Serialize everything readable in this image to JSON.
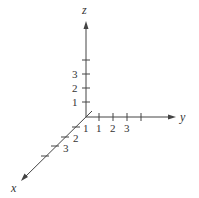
{
  "diagram": {
    "axes": {
      "x": {
        "label": "x",
        "ticks": [
          "1",
          "2",
          "3"
        ]
      },
      "y": {
        "label": "y",
        "ticks": [
          "1",
          "2",
          "3"
        ]
      },
      "z": {
        "label": "z",
        "ticks": [
          "1",
          "2",
          "3"
        ]
      }
    },
    "colors": {
      "stroke": "#444444",
      "text": "#333333",
      "background": "#ffffff"
    }
  }
}
